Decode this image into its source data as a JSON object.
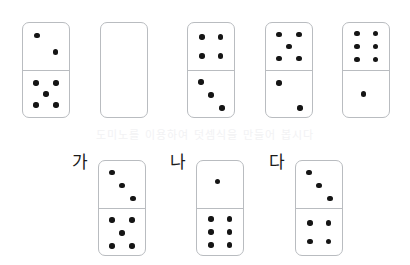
{
  "worksheet": {
    "background_color": "#ffffff",
    "pip_color": "#151515",
    "tile_border_color": "#b9bcc0",
    "faint_bleed_text": "도미노를 이용하여 덧셈식을 만들어 봅시다",
    "tile_width": 48,
    "tile_height": 96
  },
  "rows": [
    {
      "name": "top-row",
      "y": 22,
      "tiles": [
        {
          "id": "tile-1",
          "x": 22,
          "label": "",
          "blank": false,
          "top_value": 2,
          "bottom_value": 5,
          "top_pips": [
            [
              30,
              26
            ],
            [
              70,
              62
            ]
          ],
          "bottom_pips": [
            [
              28,
              26
            ],
            [
              72,
              26
            ],
            [
              50,
              50
            ],
            [
              28,
              74
            ],
            [
              72,
              74
            ]
          ]
        },
        {
          "id": "tile-2",
          "x": 100,
          "label": "",
          "blank": true,
          "top_value": null,
          "bottom_value": null,
          "top_pips": [],
          "bottom_pips": []
        },
        {
          "id": "tile-3",
          "x": 187,
          "label": "",
          "blank": false,
          "top_value": 4,
          "bottom_value": 3,
          "top_pips": [
            [
              30,
              30
            ],
            [
              70,
              30
            ],
            [
              30,
              70
            ],
            [
              70,
              70
            ]
          ],
          "bottom_pips": [
            [
              28,
              24
            ],
            [
              50,
              52
            ],
            [
              74,
              80
            ]
          ]
        },
        {
          "id": "tile-4",
          "x": 265,
          "label": "",
          "blank": false,
          "top_value": 5,
          "bottom_value": 2,
          "top_pips": [
            [
              28,
              24
            ],
            [
              72,
              24
            ],
            [
              50,
              50
            ],
            [
              28,
              76
            ],
            [
              72,
              76
            ]
          ],
          "bottom_pips": [
            [
              28,
              26
            ],
            [
              74,
              80
            ]
          ]
        },
        {
          "id": "tile-5",
          "x": 342,
          "label": "",
          "blank": false,
          "top_value": 6,
          "bottom_value": 1,
          "top_pips": [
            [
              30,
              22
            ],
            [
              70,
              22
            ],
            [
              30,
              50
            ],
            [
              70,
              50
            ],
            [
              30,
              78
            ],
            [
              70,
              78
            ]
          ],
          "bottom_pips": [
            [
              44,
              50
            ]
          ]
        }
      ]
    },
    {
      "name": "bottom-row",
      "y": 160,
      "tiles": [
        {
          "id": "tile-ga",
          "x": 98,
          "label": "가",
          "label_x": 72,
          "label_y": 154,
          "blank": false,
          "top_value": 3,
          "bottom_value": 5,
          "top_pips": [
            [
              28,
              24
            ],
            [
              50,
              52
            ],
            [
              74,
              80
            ]
          ],
          "bottom_pips": [
            [
              28,
              24
            ],
            [
              72,
              24
            ],
            [
              50,
              52
            ],
            [
              28,
              80
            ],
            [
              72,
              80
            ]
          ]
        },
        {
          "id": "tile-na",
          "x": 196,
          "label": "나",
          "label_x": 170,
          "label_y": 154,
          "blank": false,
          "top_value": 1,
          "bottom_value": 6,
          "top_pips": [
            [
              44,
              44
            ]
          ],
          "bottom_pips": [
            [
              30,
              22
            ],
            [
              70,
              22
            ],
            [
              30,
              50
            ],
            [
              70,
              50
            ],
            [
              30,
              78
            ],
            [
              70,
              78
            ]
          ]
        },
        {
          "id": "tile-da",
          "x": 295,
          "label": "다",
          "label_x": 269,
          "label_y": 154,
          "blank": false,
          "top_value": 3,
          "bottom_value": 4,
          "top_pips": [
            [
              28,
              24
            ],
            [
              50,
              52
            ],
            [
              74,
              80
            ]
          ],
          "bottom_pips": [
            [
              30,
              30
            ],
            [
              70,
              30
            ],
            [
              30,
              70
            ],
            [
              70,
              70
            ]
          ]
        }
      ]
    }
  ]
}
